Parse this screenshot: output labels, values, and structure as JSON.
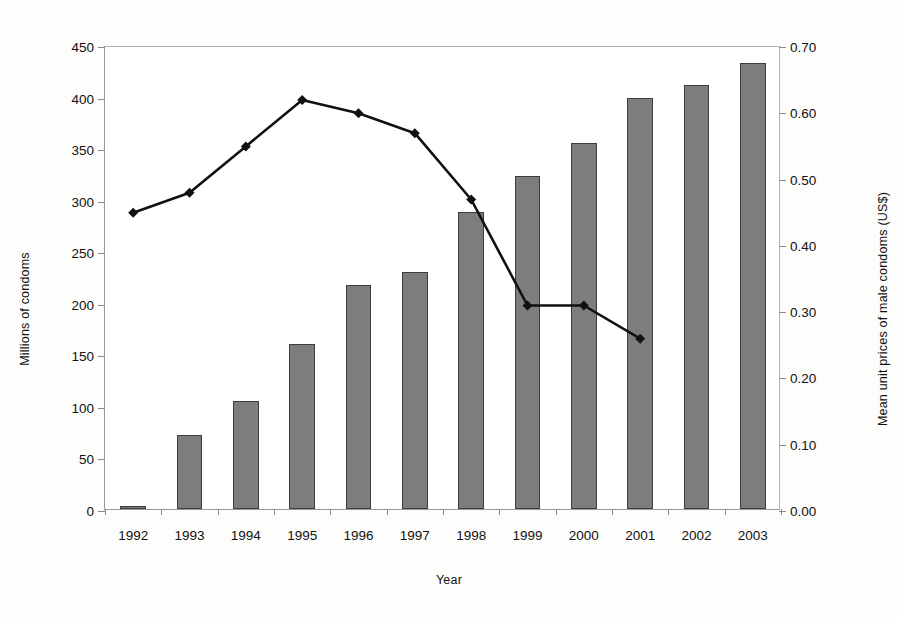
{
  "chart_data": {
    "type": "bar",
    "title": "",
    "xlabel": "Year",
    "ylabel": "Millions of condoms",
    "y2label": "Mean unit prices of male condoms (US$)",
    "categories": [
      "1992",
      "1993",
      "1994",
      "1995",
      "1996",
      "1997",
      "1998",
      "1999",
      "2000",
      "2001",
      "2002",
      "2003"
    ],
    "ylim": [
      0,
      450
    ],
    "yticks": [
      "0",
      "50",
      "100",
      "150",
      "200",
      "250",
      "300",
      "350",
      "400",
      "450"
    ],
    "ytick_values": [
      0,
      50,
      100,
      150,
      200,
      250,
      300,
      350,
      400,
      450
    ],
    "y2lim": [
      0.0,
      0.7
    ],
    "y2ticks": [
      "0.00",
      "0.10",
      "0.20",
      "0.30",
      "0.40",
      "0.50",
      "0.60",
      "0.70"
    ],
    "y2tick_values": [
      0.0,
      0.1,
      0.2,
      0.3,
      0.4,
      0.5,
      0.6,
      0.7
    ],
    "grid": false,
    "legend": "none",
    "series": [
      {
        "name": "Millions of condoms",
        "type": "bar",
        "axis": "left",
        "color": "#7d7d7d",
        "edge_color": "#3c3c3c",
        "values": [
          3,
          72,
          105,
          160,
          217,
          230,
          288,
          323,
          355,
          399,
          411,
          433
        ]
      },
      {
        "name": "Mean unit prices of male condoms (US$)",
        "type": "line",
        "axis": "right",
        "color": "#111111",
        "marker": "diamond",
        "values": [
          0.45,
          0.48,
          0.55,
          0.62,
          0.6,
          0.57,
          0.47,
          0.31,
          0.31,
          0.26,
          null,
          null
        ]
      }
    ]
  },
  "axes": {
    "x_title": "Year",
    "y_left_title": "Millions of condoms",
    "y_right_title": "Mean unit prices of male condoms (US$)"
  }
}
